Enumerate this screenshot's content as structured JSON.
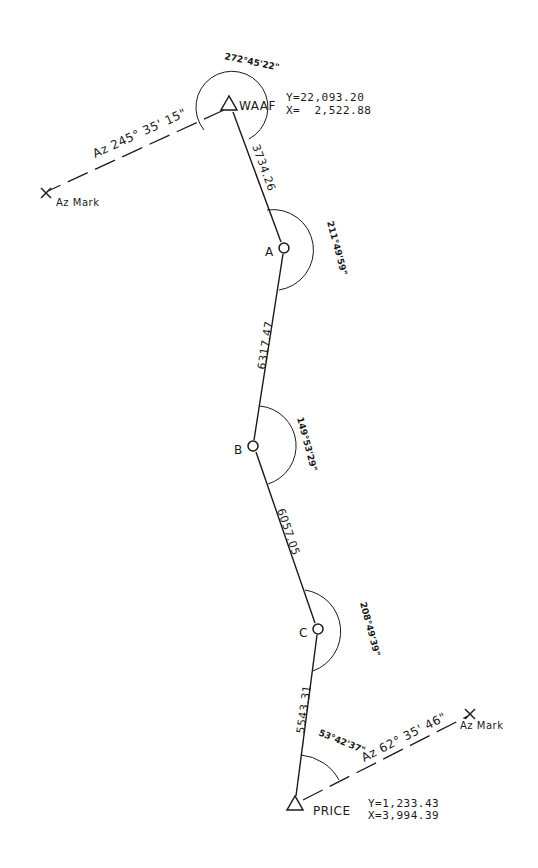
{
  "diagram": {
    "type": "traverse survey sketch",
    "stations": [
      {
        "id": "WAAF",
        "label": "WAAF",
        "marker": "triangle",
        "y_coord": "Y=22,093.20",
        "x_coord": "X=  2,522.88",
        "angle": "272°45'22\""
      },
      {
        "id": "A",
        "label": "A",
        "marker": "circle",
        "angle": "211°49'59\""
      },
      {
        "id": "B",
        "label": "B",
        "marker": "circle",
        "angle": "149°53'29\""
      },
      {
        "id": "C",
        "label": "C",
        "marker": "circle",
        "angle": "208°49'39\""
      },
      {
        "id": "PRICE",
        "label": "PRICE",
        "marker": "triangle",
        "y_coord": "Y=1,233.43",
        "x_coord": "X=3,994.39",
        "angle": "53°42'37\""
      }
    ],
    "legs": [
      {
        "from": "WAAF",
        "to": "A",
        "distance": "3734.26"
      },
      {
        "from": "A",
        "to": "B",
        "distance": "6317.47"
      },
      {
        "from": "B",
        "to": "C",
        "distance": "6057.05"
      },
      {
        "from": "C",
        "to": "PRICE",
        "distance": "5543.31"
      }
    ],
    "azimuth_marks": [
      {
        "station": "WAAF",
        "azimuth": "Az 245° 35' 15\"",
        "mark_label": "Az Mark"
      },
      {
        "station": "PRICE",
        "azimuth": "Az 62° 35' 46\"",
        "mark_label": "Az Mark"
      }
    ]
  }
}
